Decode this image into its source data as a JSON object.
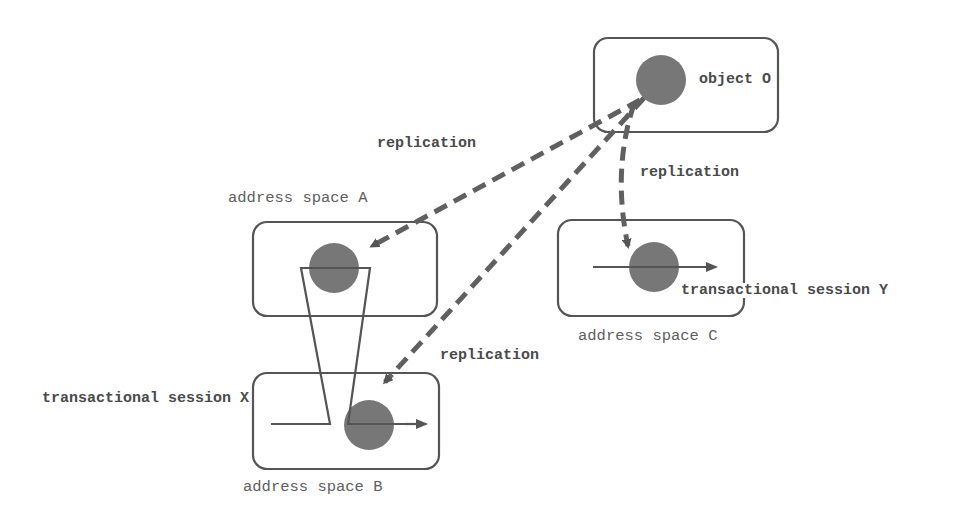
{
  "diagram": {
    "colors": {
      "stroke": "#555555",
      "object_fill": "#777777",
      "dashed_arrow": "#606060",
      "background": "#ffffff"
    },
    "nodes": {
      "object": {
        "label": "object O"
      },
      "space_a": {
        "label": "address space A"
      },
      "space_b": {
        "label": "address space B"
      },
      "space_c": {
        "label": "address space C"
      }
    },
    "sessions": {
      "x": {
        "label": "transactional session X"
      },
      "y": {
        "label": "transactional session Y"
      }
    },
    "edges": [
      {
        "from": "object O",
        "to": "address space A",
        "label": "replication",
        "style": "dashed"
      },
      {
        "from": "object O",
        "to": "address space C",
        "label": "replication",
        "style": "dashed"
      },
      {
        "from": "object O",
        "to": "address space B",
        "label": "replication",
        "style": "dashed"
      }
    ],
    "edge_labels": {
      "to_a": "replication",
      "to_c": "replication",
      "to_b": "replication"
    }
  }
}
